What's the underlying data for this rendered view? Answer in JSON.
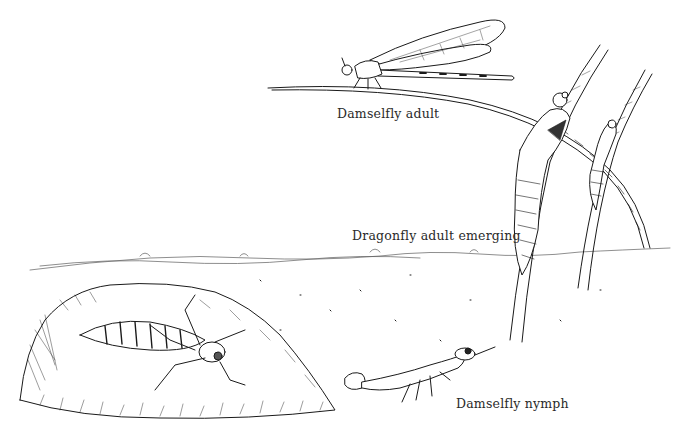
{
  "illustration": {
    "style": "pen-and-ink line drawing",
    "ink_color": "#1a1a1a",
    "background_color": "#ffffff",
    "labels": [
      {
        "id": "damselfly-adult",
        "text": "Damselfly adult",
        "x": 337,
        "y": 106
      },
      {
        "id": "dragonfly-emerging",
        "text": "Dragonfly adult emerging",
        "x": 352,
        "y": 228
      },
      {
        "id": "damselfly-nymph",
        "text": "Damselfly nymph",
        "x": 456,
        "y": 396
      }
    ],
    "subjects": [
      "damselfly adult perched on grass blade",
      "dragonfly adults emerging on reed stems",
      "dragonfly nymph on rock",
      "damselfly nymph on pond floor",
      "water surface line"
    ]
  }
}
